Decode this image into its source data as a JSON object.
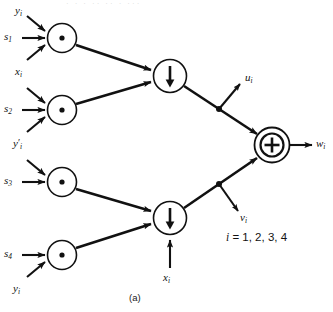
{
  "figure": {
    "caption": "(a)",
    "condition_note": "i = 1, 2, 3, 4",
    "condition_index": "i",
    "condition_values": "= 1, 2, 3, 4",
    "cropped_top_text": "· · · ·· ·· · ···",
    "colors": {
      "ink": "#111111",
      "background": "#ffffff"
    }
  },
  "inputs": [
    {
      "id": "in-y1",
      "label": "y",
      "sub": "i",
      "prime": false,
      "into": "mult-1"
    },
    {
      "id": "in-s1",
      "label": "s",
      "sub": "1",
      "prime": false,
      "into": "mult-1"
    },
    {
      "id": "in-x-top",
      "label": "x",
      "sub": "i",
      "prime": false,
      "into": "mult-1-and-2"
    },
    {
      "id": "in-s2",
      "label": "s",
      "sub": "2",
      "prime": false,
      "into": "mult-2"
    },
    {
      "id": "in-yprime",
      "label": "y",
      "sub": "i",
      "prime": true,
      "into": "mult-2-and-3"
    },
    {
      "id": "in-s3",
      "label": "s",
      "sub": "3",
      "prime": false,
      "into": "mult-3"
    },
    {
      "id": "in-s4",
      "label": "s",
      "sub": "4",
      "prime": false,
      "into": "mult-4"
    },
    {
      "id": "in-y4",
      "label": "y",
      "sub": "i",
      "prime": false,
      "into": "mult-4"
    },
    {
      "id": "in-x-bottom",
      "label": "x",
      "sub": "i",
      "prime": false,
      "into": "adder-2"
    }
  ],
  "outputs": [
    {
      "id": "out-u",
      "label": "u",
      "sub": "i",
      "from": "adder-1-tap"
    },
    {
      "id": "out-v",
      "label": "v",
      "sub": "i",
      "from": "adder-2-tap"
    },
    {
      "id": "out-w",
      "label": "w",
      "sub": "i",
      "from": "summing-node"
    }
  ],
  "nodes": [
    {
      "id": "mult-1",
      "type": "multiplier",
      "glyph": "dot",
      "name": "multiplier-s1"
    },
    {
      "id": "mult-2",
      "type": "multiplier",
      "glyph": "dot",
      "name": "multiplier-s2"
    },
    {
      "id": "mult-3",
      "type": "multiplier",
      "glyph": "dot",
      "name": "multiplier-s3"
    },
    {
      "id": "mult-4",
      "type": "multiplier",
      "glyph": "dot",
      "name": "multiplier-s4"
    },
    {
      "id": "adder-1",
      "type": "adder",
      "glyph": "down-arrow",
      "name": "adder-upper"
    },
    {
      "id": "adder-2",
      "type": "adder",
      "glyph": "down-arrow",
      "name": "adder-lower"
    },
    {
      "id": "summing",
      "type": "summing",
      "glyph": "plus-in-circle",
      "name": "summing-node"
    }
  ]
}
